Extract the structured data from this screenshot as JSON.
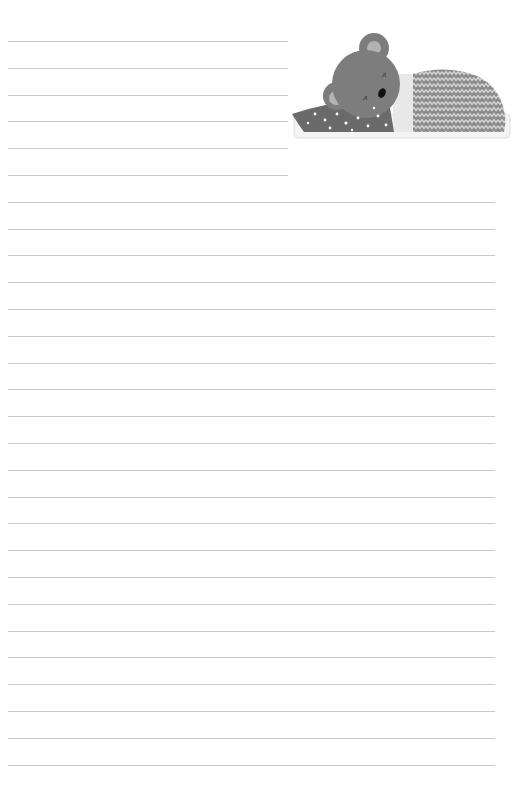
{
  "page": {
    "type": "lined-writing-paper",
    "background": "#ffffff",
    "line_color": "#c9c9c9",
    "line_spacing_px": 26.8,
    "first_line_y": 41,
    "short_line_count": 6,
    "full_line_count": 22
  },
  "illustration": {
    "subject": "sleeping-bear-under-blanket",
    "icon": "sleeping-bear-icon",
    "colors": {
      "bear": "#7d7d7d",
      "inner_ear": "#b3b3b3",
      "scarf": "#6a6a6a",
      "blanket": "#8a8a8a",
      "blanket_zigzag": "#d8d8d8",
      "mattress": "#f2f2f2",
      "sheet_band": "#e6e6e6"
    }
  }
}
